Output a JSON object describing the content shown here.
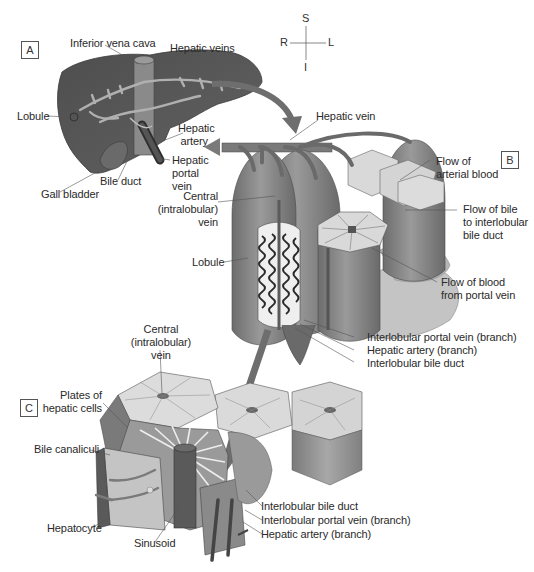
{
  "compass": {
    "superior": "S",
    "inferior": "I",
    "right": "R",
    "left": "L"
  },
  "panels": [
    {
      "id": "A",
      "label": "A"
    },
    {
      "id": "B",
      "label": "B"
    },
    {
      "id": "C",
      "label": "C"
    }
  ],
  "panel_a": {
    "labels": {
      "inferior_vena_cava": "Inferior vena cava",
      "hepatic_veins": "Hepatic veins",
      "lobule": "Lobule",
      "hepatic_artery_1": "Hepatic",
      "hepatic_artery_2": "artery",
      "hepatic_portal_vein_1": "Hepatic",
      "hepatic_portal_vein_2": "portal",
      "hepatic_portal_vein_3": "vein",
      "bile_duct": "Bile duct",
      "gall_bladder": "Gall bladder"
    }
  },
  "panel_b": {
    "labels": {
      "hepatic_vein": "Hepatic vein",
      "flow_arterial_1": "Flow of",
      "flow_arterial_2": "arterial blood",
      "central_vein_1": "Central",
      "central_vein_2": "(intralobular)",
      "central_vein_3": "vein",
      "flow_bile_1": "Flow of bile",
      "flow_bile_2": "to interlobular",
      "flow_bile_3": "bile duct",
      "lobule": "Lobule",
      "flow_portal_1": "Flow of blood",
      "flow_portal_2": "from portal vein",
      "interlobular_portal_vein": "Interlobular portal vein (branch)",
      "hepatic_artery_branch": "Hepatic artery (branch)",
      "interlobular_bile_duct": "Interlobular bile duct"
    }
  },
  "panel_c": {
    "labels": {
      "central_vein_1": "Central",
      "central_vein_2": "(intralobular)",
      "central_vein_3": "vein",
      "plates_1": "Plates of",
      "plates_2": "hepatic cells",
      "bile_canaliculi": "Bile canaliculi",
      "hepatocyte": "Hepatocyte",
      "sinusoid": "Sinusoid",
      "interlobular_bile_duct": "Interlobular bile duct",
      "interlobular_portal_vein": "Interlobular portal vein (branch)",
      "hepatic_artery_branch": "Hepatic artery (branch)"
    }
  },
  "colors": {
    "liver_dark": "#5a5a5a",
    "liver_mid": "#7a7a7a",
    "vessel": "#9a9a9a",
    "lobule_face": "#d9d9d9",
    "lobule_side": "#8c8c8c",
    "arrow": "#6e6e6e",
    "leader": "#555555",
    "text": "#2a2a2a"
  }
}
